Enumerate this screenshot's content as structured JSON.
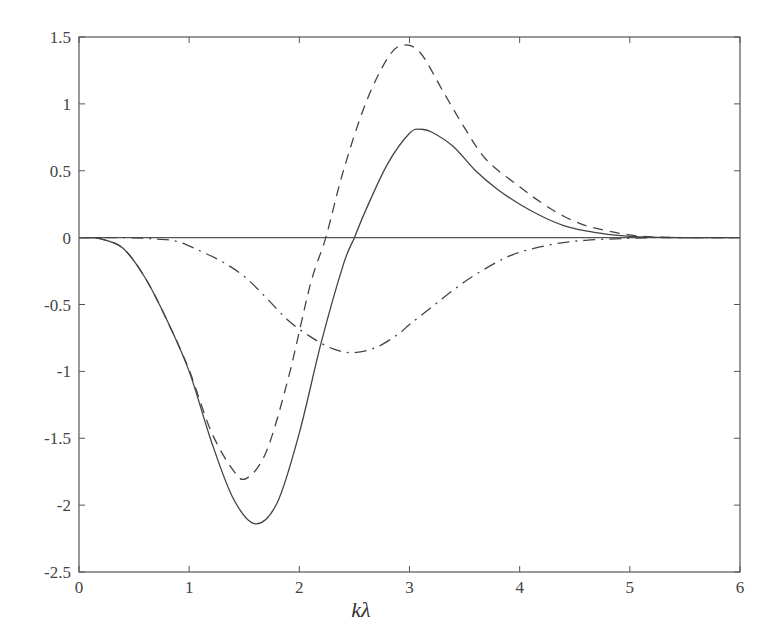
{
  "chart_data": {
    "type": "line",
    "title": "",
    "xlabel": "kλ",
    "ylabel": "",
    "xlim": [
      0,
      6
    ],
    "ylim": [
      -2.5,
      1.5
    ],
    "grid": false,
    "legend": null,
    "x_ticks": [
      "0",
      "1",
      "2",
      "3",
      "4",
      "5",
      "6"
    ],
    "y_ticks": [
      "1.5",
      "1",
      "0.5",
      "0",
      "-0.5",
      "-1",
      "-1.5",
      "-2",
      "-2.5"
    ],
    "reference_lines": [
      {
        "type": "horizontal",
        "y": 0,
        "style": "solid"
      }
    ],
    "series": [
      {
        "name": "solid",
        "style": "solid",
        "x": [
          0,
          0.2,
          0.4,
          0.6,
          0.8,
          1.0,
          1.2,
          1.4,
          1.6,
          1.8,
          2.0,
          2.2,
          2.4,
          2.5,
          2.6,
          2.8,
          3.0,
          3.1,
          3.2,
          3.4,
          3.6,
          3.8,
          4.0,
          4.2,
          4.4,
          4.6,
          4.8,
          5.0,
          5.2,
          5.5,
          6.0
        ],
        "y": [
          0,
          -0.01,
          -0.08,
          -0.3,
          -0.62,
          -1.0,
          -1.52,
          -1.95,
          -2.14,
          -1.98,
          -1.46,
          -0.78,
          -0.2,
          0.0,
          0.2,
          0.55,
          0.78,
          0.81,
          0.79,
          0.68,
          0.5,
          0.36,
          0.25,
          0.16,
          0.09,
          0.05,
          0.025,
          0.01,
          0.003,
          0.0,
          0.0
        ]
      },
      {
        "name": "dashed",
        "style": "dashed",
        "x": [
          0,
          0.2,
          0.4,
          0.6,
          0.8,
          1.0,
          1.2,
          1.4,
          1.52,
          1.7,
          1.9,
          2.1,
          2.24,
          2.4,
          2.6,
          2.8,
          2.94,
          3.1,
          3.3,
          3.5,
          3.7,
          4.0,
          4.2,
          4.4,
          4.6,
          4.8,
          5.0,
          5.2,
          5.5,
          6.0
        ],
        "y": [
          0,
          -0.01,
          -0.08,
          -0.3,
          -0.62,
          -0.99,
          -1.45,
          -1.74,
          -1.8,
          -1.6,
          -1.05,
          -0.35,
          0.0,
          0.5,
          1.0,
          1.34,
          1.44,
          1.38,
          1.1,
          0.82,
          0.58,
          0.38,
          0.26,
          0.16,
          0.09,
          0.05,
          0.02,
          0.005,
          0.0,
          0.0
        ]
      },
      {
        "name": "dash-dot",
        "style": "dash-dot",
        "x": [
          0,
          0.4,
          0.7,
          0.9,
          1.1,
          1.3,
          1.5,
          1.7,
          1.9,
          2.1,
          2.3,
          2.49,
          2.7,
          2.9,
          3.0,
          3.2,
          3.5,
          3.8,
          4.0,
          4.3,
          4.6,
          5.0,
          5.3,
          6.0
        ],
        "y": [
          0,
          0,
          -0.01,
          -0.03,
          -0.1,
          -0.18,
          -0.29,
          -0.45,
          -0.62,
          -0.74,
          -0.83,
          -0.86,
          -0.82,
          -0.72,
          -0.65,
          -0.52,
          -0.33,
          -0.18,
          -0.11,
          -0.05,
          -0.02,
          -0.005,
          0.0,
          0.0
        ]
      }
    ]
  }
}
